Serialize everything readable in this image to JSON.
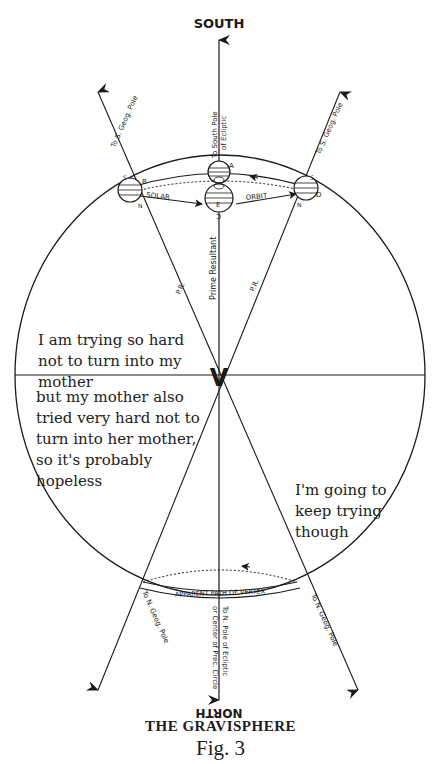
{
  "diagram": {
    "title_top": "SOUTH",
    "title_bottom_inverted": "NORTH",
    "caption_title": "THE GRAVISPHERE",
    "caption_fig": "Fig. 3",
    "labels": {
      "to_s_geog_pole_left": "To S. Geog. Pole",
      "to_s_geog_pole_right": "To S. Geog. Pole",
      "to_south_pole_ecliptic_1": "To South Pole",
      "to_south_pole_ecliptic_2": "of Ecliptic",
      "solar": "SOLAR",
      "orbit": "ORBIT",
      "prime_resultant": "Prime Resultant",
      "pr_left": "P.R.",
      "pr_right": "P.R.",
      "vertex": "V",
      "apparent_path": "APPARENT PATH OF VERTEX",
      "to_n_geog_pole_left": "To N. Geog. Pole",
      "to_n_geog_pole_right": "To N. Geog. Pole",
      "to_n_pole_ecliptic_1": "To N. Pole of Ecliptic",
      "to_n_pole_ecliptic_2": "or Center of Prec. Circle",
      "point_a": "A",
      "point_b": "B",
      "point_c": "C",
      "point_d": "D",
      "point_e": "E",
      "s_left": "S",
      "n_left": "N",
      "s_right": "S",
      "n_right": "N",
      "s_center": "S"
    },
    "annotations": {
      "upper_left": "I am trying so hard not to turn into my mother",
      "lower_left": "but my mother also tried very hard not to turn into her mother, so it's probably hopeless",
      "lower_right": "I'm going to keep trying though"
    }
  }
}
